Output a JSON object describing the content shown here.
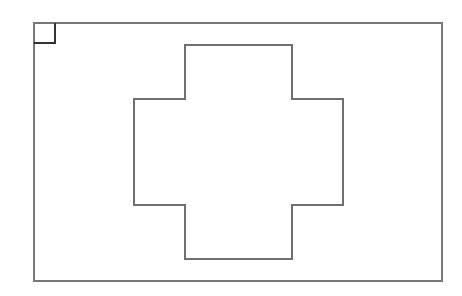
{
  "canvas": {
    "width": 462,
    "height": 296,
    "background": "#ffffff"
  },
  "colors": {
    "frame": "#777777",
    "corner_marker": "#333333",
    "cross": "#6f6f6f"
  },
  "frame": {
    "x": 34,
    "y": 23,
    "width": 408,
    "height": 258
  },
  "corner_marker": {
    "x": 34,
    "y": 23,
    "width": 21,
    "height": 20
  },
  "cross": {
    "points": "185,45 292,45 292,99 343,99 343,205 292,205 292,259 185,259 185,205 134,205 134,99 185,99"
  }
}
